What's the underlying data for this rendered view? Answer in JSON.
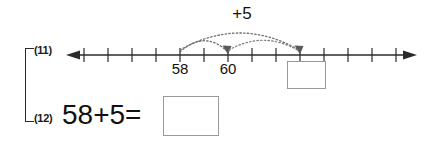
{
  "worksheet": {
    "background_color": "#ffffff",
    "line_color": "#2b2b2b",
    "box_border_color": "#9a9a9a",
    "arc_color": "#6e6e6e"
  },
  "problems": [
    {
      "number_label": "(11)",
      "type": "number-line",
      "jump_total_label": "+5",
      "start_value": "58",
      "midpoint_value": "60",
      "answer_box_value": "",
      "tick_labels": [
        "58",
        "60"
      ]
    },
    {
      "number_label": "(12)",
      "type": "equation",
      "expression": "58+5=",
      "answer_box_value": ""
    }
  ],
  "number_line": {
    "left_arrow_icon": "left-arrowhead-icon",
    "right_arrow_icon": "right-arrowhead-icon",
    "tick_count": 14,
    "jump_arc_1": {
      "from": "58",
      "to": "60",
      "icon": "dotted-jump-arc-icon"
    },
    "jump_arc_2": {
      "from": "58",
      "to": "answer",
      "icon": "dotted-jump-arc-icon"
    }
  }
}
